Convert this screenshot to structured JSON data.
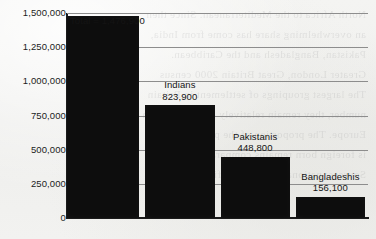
{
  "chart_data": {
    "type": "bar",
    "title": "",
    "subtitle": "",
    "xlabel": "",
    "ylabel": "",
    "categories": [
      "Total",
      "Indians",
      "Pakistanis",
      "Bangladeshis"
    ],
    "values": [
      1476900,
      823900,
      448800,
      156100
    ],
    "value_labels": [
      "1,476,900",
      "823,900",
      "448,800",
      "156,100"
    ],
    "bar_annotations": [
      {
        "name": "Total =",
        "value": "1,476,900",
        "combined": "Total = 1,476,900",
        "style": "inline-left"
      },
      {
        "name": "Indians",
        "value": "823,900",
        "style": "above-center"
      },
      {
        "name": "Pakistanis",
        "value": "448,800",
        "style": "above-center"
      },
      {
        "name": "Bangladeshis",
        "value": "156,100",
        "style": "above-center"
      }
    ],
    "ylim": [
      0,
      1500000
    ],
    "yticks": [
      1500000,
      1250000,
      1000000,
      750000,
      500000,
      250000,
      0
    ],
    "ytick_labels": [
      "1,500,000",
      "1,250,000",
      "1,000,000",
      "750,000",
      "500,000",
      "250,000",
      "0"
    ],
    "grid": true,
    "grid_axis": "y",
    "legend": false,
    "bar_color": "#0d0d0d",
    "background_color": "#f1f1ef",
    "axis_color": "#1a1a1a",
    "grid_color": "#8d8d8d"
  },
  "bleed_text": [
    "North Africa to the Mediterranean. Since then",
    "an overwhelming share has come from India,",
    "Pakistan, Bangladesh and the Caribbean.",
    "",
    "Greater London, Great Britain 2000 census",
    "estimate.",
    "",
    "The largest groupings of settlement in Britain",
    "number, they remain relatively concentrated in",
    "Europe. The proportion of the population that",
    "is foreign born remains comparatively small.",
    "Sources: national statistical offices; census"
  ]
}
